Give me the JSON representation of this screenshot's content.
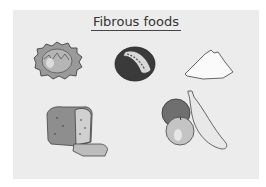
{
  "title": "Fibrous foods",
  "items": [
    {
      "name": "cabbage",
      "label": "Cabbage"
    },
    {
      "name": "avocado",
      "label": "Fruit with seeds"
    },
    {
      "name": "flour-pile",
      "label": "Flour"
    },
    {
      "name": "bread-loaf",
      "label": "Bread"
    },
    {
      "name": "fruits",
      "label": "Orange, apple and banana"
    }
  ],
  "colors": {
    "background": "#ffffff",
    "panel": "#ececec",
    "ink": "#333333"
  }
}
